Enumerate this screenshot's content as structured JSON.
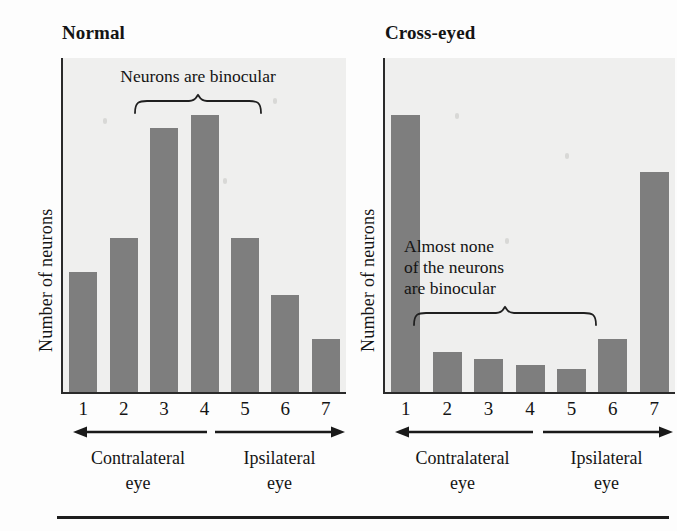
{
  "figure": {
    "y_axis_label": "Number of neurons",
    "x_tick_labels": [
      "1",
      "2",
      "3",
      "4",
      "5",
      "6",
      "7"
    ],
    "contralateral_label": "Contralateral\neye",
    "ipsilateral_label": "Ipsilateral\neye",
    "bar_color": "#7e7e7e",
    "axis_color": "#2a2a2a",
    "plot_bg": "#efefee"
  },
  "panels": [
    {
      "id": "normal",
      "title": "Normal",
      "annotation": "Neurons are binocular",
      "brace_span": [
        3,
        5
      ]
    },
    {
      "id": "cross",
      "title": "Cross-eyed",
      "annotation": "Almost none\nof the neurons\nare binocular",
      "brace_span": [
        2,
        6
      ]
    }
  ],
  "chart_data": [
    {
      "type": "bar",
      "title": "Normal",
      "categories": [
        "1",
        "2",
        "3",
        "4",
        "5",
        "6",
        "7"
      ],
      "values": [
        36,
        46,
        79,
        83,
        46,
        29,
        16
      ],
      "xlabel": "Ocular dominance category",
      "ylabel": "Number of neurons",
      "ylim": [
        0,
        100
      ],
      "grid": false,
      "legend": "none",
      "annotations": [
        {
          "text": "Neurons are binocular",
          "covers": [
            "3",
            "4",
            "5"
          ]
        }
      ],
      "axis_direction_labels": [
        {
          "text": "Contralateral eye",
          "covers": [
            "1",
            "2",
            "3",
            "4"
          ],
          "arrow": "left"
        },
        {
          "text": "Ipsilateral eye",
          "covers": [
            "5",
            "6",
            "7"
          ],
          "arrow": "right"
        }
      ]
    },
    {
      "type": "bar",
      "title": "Cross-eyed",
      "categories": [
        "1",
        "2",
        "3",
        "4",
        "5",
        "6",
        "7"
      ],
      "values": [
        83,
        12,
        10,
        8,
        7,
        16,
        66
      ],
      "xlabel": "Ocular dominance category",
      "ylabel": "Number of neurons",
      "ylim": [
        0,
        100
      ],
      "grid": false,
      "legend": "none",
      "annotations": [
        {
          "text": "Almost none of the neurons are binocular",
          "covers": [
            "2",
            "3",
            "4",
            "5",
            "6"
          ]
        }
      ],
      "axis_direction_labels": [
        {
          "text": "Contralateral eye",
          "covers": [
            "1",
            "2",
            "3",
            "4"
          ],
          "arrow": "left"
        },
        {
          "text": "Ipsilateral eye",
          "covers": [
            "5",
            "6",
            "7"
          ],
          "arrow": "right"
        }
      ]
    }
  ]
}
